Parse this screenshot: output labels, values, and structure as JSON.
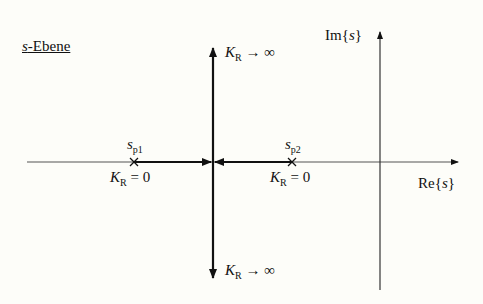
{
  "diagram": {
    "title_italic": "s",
    "title_rest": "-Ebene",
    "axes": {
      "im_label_prefix": "Im{",
      "im_label_var": "s",
      "im_label_suffix": "}",
      "re_label_prefix": "Re{",
      "re_label_var": "s",
      "re_label_suffix": "}"
    },
    "poles": [
      {
        "name": "s",
        "sub": "p1",
        "gain_K": "K",
        "gain_sub": "R",
        "gain_value": "= 0"
      },
      {
        "name": "s",
        "sub": "p2",
        "gain_K": "K",
        "gain_sub": "R",
        "gain_value": "= 0"
      }
    ],
    "branches": {
      "up": {
        "K": "K",
        "sub": "R",
        "value": "→ ∞"
      },
      "down": {
        "K": "K",
        "sub": "R",
        "value": "→ ∞"
      }
    },
    "colors": {
      "line": "#111111",
      "background": "#fdfdf9"
    }
  }
}
